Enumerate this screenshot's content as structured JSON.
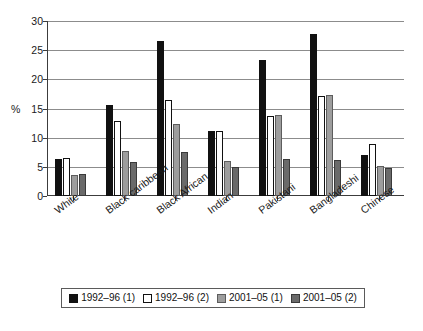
{
  "chart_data": {
    "type": "bar",
    "title": "",
    "subtitle": "",
    "xlabel": "",
    "ylabel": "%",
    "ylim": [
      0,
      30
    ],
    "yticks": [
      0,
      5,
      10,
      15,
      20,
      25,
      30
    ],
    "ytick_labels": [
      "0",
      "5",
      "10",
      "15",
      "20",
      "25",
      "30"
    ],
    "grid": true,
    "grid_axis": "y",
    "legend_position": "bottom",
    "orientation": "vertical",
    "categories": [
      "White",
      "Black caribbean",
      "Black African",
      "Indian",
      "Pakistani",
      "Bangladeshi",
      "Chinese"
    ],
    "series": [
      {
        "name": "1992–96 (1)",
        "color": "#111111",
        "values": [
          6.4,
          15.6,
          26.5,
          11.2,
          23.4,
          27.8,
          7.1
        ]
      },
      {
        "name": "1992–96 (2)",
        "color": "#ffffff",
        "values": [
          6.5,
          12.8,
          16.4,
          11.1,
          13.7,
          17.2,
          8.9
        ]
      },
      {
        "name": "2001–05 (1)",
        "color": "#9d9d9d",
        "values": [
          3.6,
          7.8,
          12.3,
          6.0,
          13.9,
          17.3,
          5.1
        ]
      },
      {
        "name": "2001–05 (2)",
        "color": "#6a6a6a",
        "values": [
          3.7,
          5.9,
          7.5,
          5.0,
          6.3,
          6.1,
          4.8
        ]
      }
    ]
  },
  "legend": {
    "items": [
      {
        "label": "1992–96 (1)",
        "swatch": "#111111",
        "border": "#111111"
      },
      {
        "label": "1992–96 (2)",
        "swatch": "#ffffff",
        "border": "#111111"
      },
      {
        "label": "2001–05 (1)",
        "swatch": "#9d9d9d",
        "border": "#5d5d5d"
      },
      {
        "label": "2001–05 (2)",
        "swatch": "#6a6a6a",
        "border": "#3a3a3a"
      }
    ]
  },
  "axis": {
    "y_title": "%"
  }
}
